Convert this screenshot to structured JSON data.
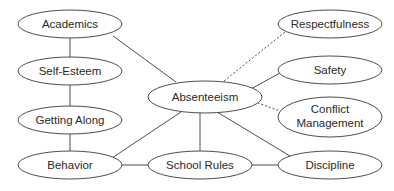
{
  "diagram": {
    "type": "concept-map",
    "center": "Absenteeism",
    "nodes": {
      "academics": "Academics",
      "self_esteem": "Self-Esteem",
      "getting_along": "Getting Along",
      "behavior": "Behavior",
      "absenteeism": "Absenteeism",
      "school_rules": "School Rules",
      "respectfulness": "Respectfulness",
      "safety": "Safety",
      "conflict_line1": "Conflict",
      "conflict_line2": "Management",
      "discipline": "Discipline"
    },
    "edges": [
      {
        "from": "Academics",
        "to": "Self-Esteem",
        "style": "solid"
      },
      {
        "from": "Self-Esteem",
        "to": "Getting Along",
        "style": "solid"
      },
      {
        "from": "Getting Along",
        "to": "Behavior",
        "style": "solid"
      },
      {
        "from": "Academics",
        "to": "Absenteeism",
        "style": "solid"
      },
      {
        "from": "Absenteeism",
        "to": "Behavior",
        "style": "solid"
      },
      {
        "from": "Absenteeism",
        "to": "School Rules",
        "style": "solid"
      },
      {
        "from": "Absenteeism",
        "to": "Discipline",
        "style": "solid"
      },
      {
        "from": "Absenteeism",
        "to": "Safety",
        "style": "solid"
      },
      {
        "from": "Absenteeism",
        "to": "Respectfulness",
        "style": "dashed"
      },
      {
        "from": "Absenteeism",
        "to": "Conflict Management",
        "style": "dashed"
      },
      {
        "from": "Behavior",
        "to": "School Rules",
        "style": "solid"
      },
      {
        "from": "School Rules",
        "to": "Discipline",
        "style": "solid"
      }
    ]
  }
}
